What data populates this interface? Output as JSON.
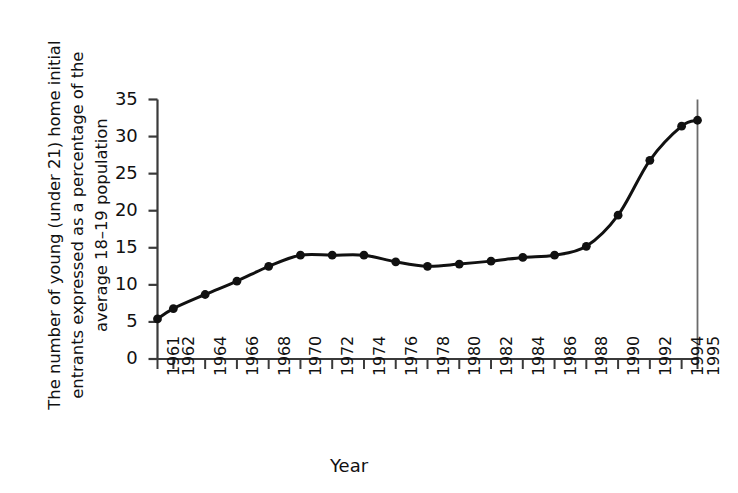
{
  "chart_data": {
    "type": "line",
    "title": "",
    "xlabel": "Year",
    "ylabel": "The number of young (under 21) home initial entrants expressed as a percentage of the average 18–19 population",
    "categories": [
      "1961",
      "1962",
      "1964",
      "1966",
      "1968",
      "1970",
      "1972",
      "1974",
      "1976",
      "1978",
      "1980",
      "1982",
      "1984",
      "1986",
      "1988",
      "1990",
      "1992",
      "1994",
      "1995"
    ],
    "x": [
      1961,
      1962,
      1964,
      1966,
      1968,
      1970,
      1972,
      1974,
      1976,
      1978,
      1980,
      1982,
      1984,
      1986,
      1988,
      1990,
      1992,
      1994,
      1995
    ],
    "values": [
      5.4,
      6.8,
      8.7,
      10.5,
      12.5,
      14.0,
      14.0,
      14.0,
      13.1,
      12.5,
      12.8,
      13.2,
      13.7,
      14.0,
      15.2,
      19.4,
      26.8,
      31.4,
      32.2
    ],
    "series": [
      {
        "name": "Young home initial entrants",
        "values": [
          5.4,
          6.8,
          8.7,
          10.5,
          12.5,
          14.0,
          14.0,
          14.0,
          13.1,
          12.5,
          12.8,
          13.2,
          13.7,
          14.0,
          15.2,
          19.4,
          26.8,
          31.4,
          32.2
        ]
      }
    ],
    "xlim": [
      1961,
      1995
    ],
    "ylim": [
      0,
      35
    ],
    "yticks": [
      0,
      5,
      10,
      15,
      20,
      25,
      30,
      35
    ],
    "ytick_labels": [
      "0",
      "5",
      "10",
      "15",
      "20",
      "25",
      "30",
      "35"
    ],
    "xtick_labels": [
      "1961",
      "1962",
      "1964",
      "1966",
      "1968",
      "1970",
      "1972",
      "1974",
      "1976",
      "1978",
      "1980",
      "1982",
      "1984",
      "1986",
      "1988",
      "1990",
      "1992",
      "1994",
      "1995"
    ],
    "grid": false,
    "legend": null,
    "marker": "filled-circle",
    "line_color": "#111111",
    "marker_color": "#111111",
    "background_color": "#ffffff",
    "annotations": []
  }
}
